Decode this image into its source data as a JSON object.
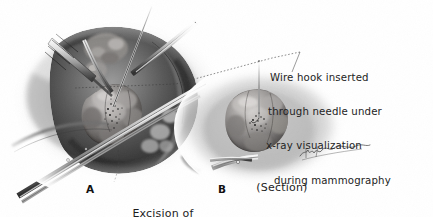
{
  "figure": {
    "kind": "medical-illustration",
    "background_color": "#ffffff",
    "ink_color": "#1b1b1b",
    "style": "graphite pencil / wash halftone, grayscale",
    "width": 433,
    "height": 217
  },
  "annotation": {
    "name": "wire-hook-annotation",
    "lines": [
      "Wire hook inserted",
      "through needle under",
      "x-ray visualization",
      "during mammography"
    ],
    "leader_line": "dotted line running from the text block down-left into panel A",
    "text": "Wire hook inserted through needle under x-ray visualization during mammography"
  },
  "panels": [
    {
      "letter": "A",
      "caption_line_1": "Excision of",
      "caption_line_2": "tumor",
      "caption": "Excision of tumor",
      "contents": "open surgical wound of the breast held apart by a rake retractor and skin hooks; lobulated tumor mass with stippled calcifications at its center; localization wire entering from above; long hemostat / forceps crossing the field to the lower left"
    },
    {
      "letter": "B",
      "caption": "(Section)",
      "contents": "excised specimen held in a clamp, cut surface showing the wire hook tip and the cluster of calcifications at the center"
    }
  ],
  "signature": {
    "name": "artist-signature",
    "text": "",
    "description": "illegible cursive artist signature at lower right of panel B"
  },
  "palette": {
    "paper": "#ffffff",
    "ink": "#1b1b1b",
    "tissue_mid": "#8c8c8c",
    "tissue_dark": "#3a3a3a",
    "tissue_light": "#d2d2d2",
    "steel": "#b9b9b9",
    "steel_dark": "#5a5a5a"
  }
}
